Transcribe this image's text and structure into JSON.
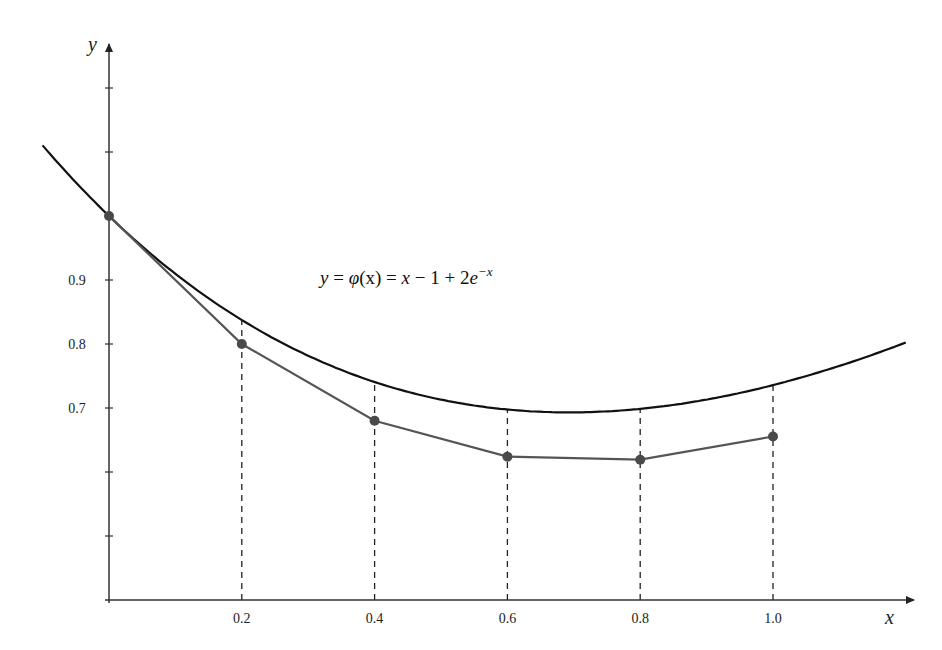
{
  "chart_data": {
    "type": "line",
    "title": "",
    "xlabel": "x",
    "ylabel": "y",
    "xlim": [
      -0.1,
      1.2
    ],
    "ylim": [
      0.5,
      1.3
    ],
    "grid": false,
    "x_ticks": [
      0.2,
      0.4,
      0.6,
      0.8,
      1.0
    ],
    "x_tick_labels": [
      "0.2",
      "0.4",
      "0.6",
      "0.8",
      "1.0"
    ],
    "y_ticks": [
      1.2,
      1.1,
      1.0,
      0.9,
      0.8,
      0.7,
      0.6,
      0.5
    ],
    "y_tick_labels": [
      "",
      "",
      "",
      "0.9",
      "0.8",
      "0.7",
      "",
      ""
    ],
    "annotations": [
      {
        "text": "y = φ(x) = x − 1 + 2e^(−x)",
        "x": 0.3,
        "y": 0.88,
        "label_parts": {
          "lhs": "y",
          "eq1": " = ",
          "phi": "φ",
          "arg": "(x)",
          "eq2": " = ",
          "x": "x",
          "minus": " − 1 + 2",
          "e": "e",
          "exp": "−x"
        }
      }
    ],
    "series": [
      {
        "name": "y = φ(x) = x − 1 + 2e^(−x)",
        "kind": "exact_curve",
        "color": "#111111",
        "x": [
          -0.1,
          0.0,
          0.1,
          0.2,
          0.3,
          0.4,
          0.5,
          0.6,
          0.7,
          0.8,
          0.9,
          1.0,
          1.1,
          1.2
        ],
        "values": [
          1.1103,
          1.0,
          0.9097,
          0.8375,
          0.7816,
          0.7406,
          0.7131,
          0.6976,
          0.6932,
          0.6987,
          0.7131,
          0.7358,
          0.7657,
          0.8024
        ]
      },
      {
        "name": "Euler approximation",
        "kind": "polyline_with_markers",
        "color": "#555555",
        "x": [
          0.0,
          0.2,
          0.4,
          0.6,
          0.8,
          1.0
        ],
        "values": [
          1.0,
          0.8,
          0.68,
          0.624,
          0.6192,
          0.6554
        ]
      }
    ],
    "guides": {
      "style": "dashed",
      "x": [
        0.2,
        0.4,
        0.6,
        0.8,
        1.0
      ],
      "from": "x-axis",
      "to": "exact_curve"
    },
    "legend": null
  }
}
